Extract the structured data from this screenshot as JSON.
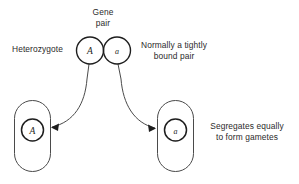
{
  "figure": {
    "title_visible": false,
    "background_color": "#ffffff",
    "stroke_color": "#1e1e1e",
    "text_color": "#2b2b2b"
  },
  "labels": {
    "gene_pair": "Gene\npair",
    "heterozygote": "Heterozygote",
    "bound_pair": "Normally a tightly\nbound pair",
    "segregates": "Segregates equally\nto form gametes"
  },
  "gene_pair": {
    "left_allele": "A",
    "right_allele": "a"
  },
  "gametes": [
    {
      "name": "left-gamete",
      "allele": "A"
    },
    {
      "name": "right-gamete",
      "allele": "a"
    }
  ],
  "arrows": [
    {
      "name": "arrow-to-left-gamete",
      "direction": "down-left"
    },
    {
      "name": "arrow-to-right-gamete",
      "direction": "down-right"
    }
  ]
}
